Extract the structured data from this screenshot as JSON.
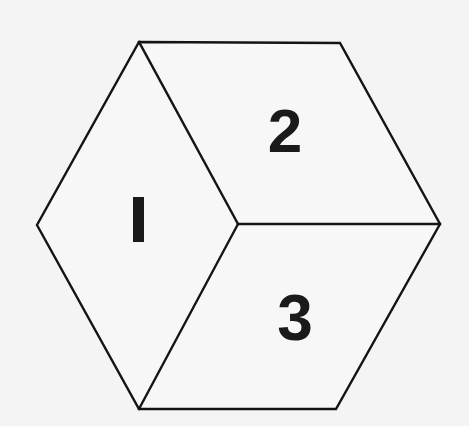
{
  "diagram": {
    "type": "isometric-cube",
    "colors": {
      "background": "#f4f4f4",
      "stroke": "#141414",
      "label": "#1a1a1a"
    },
    "vertices": {
      "top_left": [
        139,
        42
      ],
      "top_right": [
        340,
        43
      ],
      "right": [
        440,
        224
      ],
      "bottom_right": [
        336,
        409
      ],
      "bottom_left": [
        139,
        409
      ],
      "left": [
        37,
        225
      ],
      "center": [
        238,
        224
      ]
    },
    "faces": [
      {
        "id": "face-1",
        "label": "1",
        "position": "left"
      },
      {
        "id": "face-2",
        "label": "2",
        "position": "top-right"
      },
      {
        "id": "face-3",
        "label": "3",
        "position": "bottom-right"
      }
    ]
  }
}
